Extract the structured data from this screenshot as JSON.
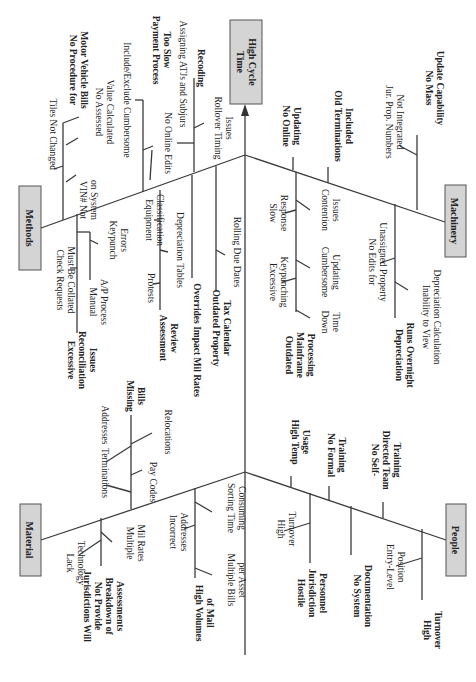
{
  "diagram": {
    "type": "fishbone (Ishikawa), rotated 90° clockwise",
    "effect": {
      "line1": "High Cycle",
      "line2": "Time"
    },
    "categories": {
      "methods": {
        "label": "Methods",
        "causes": {
          "no_procedure_motor_vehicle": {
            "line1": "No Procedure for",
            "line2": "Motor Vehicle Bills"
          },
          "tiles_not_changed": "Tiles Not Changed",
          "vin_not_on_system": {
            "line1": "VIN# Not",
            "line2": "on System"
          },
          "no_assessed_value": {
            "line1": "No Assessed",
            "line2": "Value Calculated"
          },
          "payment_process_slow": {
            "line1": "Payment Process",
            "line2": "Too Slow"
          },
          "include_exclude": "Include/Exclude Cumbersome",
          "no_online_edits": "No Online Edits",
          "recoding": "Recoding",
          "assigning_atjs": "Assigning ATJs and Subjurs",
          "rollover_timing": {
            "line1": "Rollover Timing",
            "line2": "Issues"
          },
          "excessive_reconciliation": {
            "line1": "Excessive",
            "line2": "Reconciliation",
            "line3": "Issues"
          },
          "check_requests": {
            "line1": "Check Requests",
            "line2": "Must Be Collated"
          },
          "manual_ap": {
            "line1": "Manual",
            "line2": "A/P Process"
          },
          "keypunch_errors": {
            "line1": "Keypunch",
            "line2": "Errors"
          },
          "assessment_review": {
            "line1": "Assessment",
            "line2": "Review"
          },
          "protests": "Protests",
          "equipment_classification": {
            "line1": "Equipment",
            "line2": "Classification"
          },
          "depreciation_tables": "Depreciation Tables",
          "overrides_impact": "Overrides Impact Mil Rates",
          "outdated_tax_calendar": {
            "line1": "Outdated Property",
            "line2": "Tax Calendar"
          },
          "rolling_due_dates": "Rolling Due Dates"
        }
      },
      "machinery": {
        "label": "Machinery",
        "causes": {
          "no_online_updating": {
            "line1": "No Online",
            "line2": "Updating"
          },
          "old_terminations": {
            "line1": "Old Terminations",
            "line2": "Included"
          },
          "no_mass_update": {
            "line1": "No Mass",
            "line2": "Update Capability"
          },
          "jur_prop_numbers": {
            "line1": "Jur. Prop. Numbers",
            "line2": "Not Integrated"
          },
          "outdated_mainframe": {
            "line1": "Outdated",
            "line2": "Mainframe",
            "line3": "Processing"
          },
          "slow_response": {
            "line1": "Slow",
            "line2": "Response"
          },
          "excessive_keypunching": {
            "line1": "Excessive",
            "line2": "Keypunching"
          },
          "contention_issues": {
            "line1": "Contention",
            "line2": "Issues"
          },
          "cumbersome_updating": {
            "line1": "Cumbersome",
            "line2": "Updating"
          },
          "down_time": {
            "line1": "Down",
            "line2": "Time"
          },
          "depreciation_overnight": {
            "line1": "Depreciation",
            "line2": "Runs Overnight"
          },
          "no_edits_unassigned": {
            "line1": "No Edits for",
            "line2": "Unassigned Property"
          },
          "inability_view_depr": {
            "line1": "Inability to View",
            "line2": "Depreciation Calculation"
          }
        }
      },
      "material": {
        "label": "Material",
        "causes": {
          "missing_bills": {
            "line1": "Missing",
            "line2": "Bills"
          },
          "terminations": "Terminations",
          "addresses": "Addresses",
          "pay_codes": "Pay Codes",
          "relocations": "Relocations",
          "jurisdictions_breakdown": {
            "line1": "Jurisdictions Will",
            "line2": "Not Provide",
            "line3": "Breakdown of",
            "line4": "Assessments"
          },
          "lack_technology": {
            "line1": "Lack",
            "line2": "Technology"
          },
          "multiple_mil_rates": {
            "line1": "Multiple",
            "line2": "Mil Rates"
          },
          "high_volumes_mail": {
            "line1": "High Volumes",
            "line2": "of Mail"
          },
          "incorrect_addresses": {
            "line1": "Incorrect",
            "line2": "Addresses"
          },
          "sorting_time": {
            "line1": "Sorting Time",
            "line2": "Consuming"
          },
          "multiple_bills": {
            "line1": "Multiple Bills",
            "line2": "per Asset"
          }
        }
      },
      "people": {
        "label": "People",
        "causes": {
          "high_temp_usage": {
            "line1": "High Temp",
            "line2": "Usage"
          },
          "no_formal_training": {
            "line1": "No Formal",
            "line2": "Training"
          },
          "no_self_directed": {
            "line1": "No Self-",
            "line2": "Directed Team",
            "line3": "Training"
          },
          "hostile_personnel": {
            "line1": "Hostile",
            "line2": "Jurisdiction",
            "line3": "Personnel"
          },
          "high_turnover_sub": {
            "line1": "High",
            "line2": "Turnover"
          },
          "no_system_documentation": {
            "line1": "No System",
            "line2": "Documentation"
          },
          "high_turnover": {
            "line1": "High",
            "line2": "Turnover"
          },
          "entry_level": {
            "line1": "Entry-Level",
            "line2": "Position"
          }
        }
      }
    },
    "colors": {
      "box_fill": "#d4d4d4",
      "box_stroke": "#555555",
      "line": "#3a3a3a",
      "text": "#222222"
    }
  }
}
